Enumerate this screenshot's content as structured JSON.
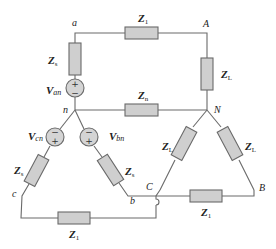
{
  "diagram": {
    "type": "three-phase wye-wye circuit",
    "nodes": {
      "a": "a",
      "A": "A",
      "n": "n",
      "N": "N",
      "b": "b",
      "B": "B",
      "c": "c",
      "C": "C"
    },
    "impedances": {
      "z1_top": {
        "main": "Z",
        "sub": "1"
      },
      "zs_a": {
        "main": "Z",
        "sub": "s"
      },
      "zn": {
        "main": "Z",
        "sub": "n"
      },
      "zl_a": {
        "main": "Z",
        "sub": "L"
      },
      "zs_c": {
        "main": "Z",
        "sub": "s"
      },
      "zs_b": {
        "main": "Z",
        "sub": "s"
      },
      "zl_c": {
        "main": "Z",
        "sub": "L"
      },
      "zl_b": {
        "main": "Z",
        "sub": "L"
      },
      "z1_cb": {
        "main": "Z",
        "sub": "1"
      },
      "z1_bottom": {
        "main": "Z",
        "sub": "1"
      }
    },
    "sources": {
      "van": {
        "main": "V",
        "sub": "an",
        "top_sign": "+",
        "bottom_sign": "−"
      },
      "vcn": {
        "main": "V",
        "sub": "cn",
        "top_sign": "−",
        "bottom_sign": "+"
      },
      "vbn": {
        "main": "V",
        "sub": "bn",
        "top_sign": "−",
        "bottom_sign": "+"
      }
    },
    "colors": {
      "wire": "#6a6a6a",
      "impedance_fill": "#cfcfcf",
      "source_fill": "#d4d4d4",
      "text": "#222222"
    }
  }
}
